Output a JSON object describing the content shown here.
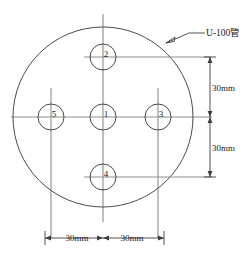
{
  "diagram": {
    "title_note": "U-100管",
    "background_color": "#ffffff",
    "line_color": "#4a4a4a",
    "centerline_color": "#8d8d8d",
    "pipe": {
      "label": "U-100管",
      "shape": "circle",
      "center": {
        "x": 103,
        "y": 117
      },
      "radius": 90
    },
    "holes": [
      {
        "id": "1",
        "label": "1",
        "position": "center",
        "cx": 103,
        "cy": 117,
        "r": 13
      },
      {
        "id": "2",
        "label": "2",
        "position": "top",
        "cx": 103,
        "cy": 57,
        "r": 13
      },
      {
        "id": "3",
        "label": "3",
        "position": "right",
        "cx": 158,
        "cy": 117,
        "r": 13
      },
      {
        "id": "4",
        "label": "4",
        "position": "bottom",
        "cx": 103,
        "cy": 177,
        "r": 13
      },
      {
        "id": "5",
        "label": "5",
        "position": "left",
        "cx": 51,
        "cy": 117,
        "r": 13
      }
    ],
    "dimensions": [
      {
        "id": "vertical-upper",
        "label": "30mm",
        "orientation": "vertical",
        "from": "hole-2",
        "to": "hole-1"
      },
      {
        "id": "vertical-lower",
        "label": "30mm",
        "orientation": "vertical",
        "from": "hole-1",
        "to": "hole-4"
      },
      {
        "id": "horizontal-left",
        "label": "30mm",
        "orientation": "horizontal",
        "from": "hole-5",
        "to": "hole-1"
      },
      {
        "id": "horizontal-right",
        "label": "30mm",
        "orientation": "horizontal",
        "from": "hole-1",
        "to": "hole-3"
      }
    ]
  }
}
